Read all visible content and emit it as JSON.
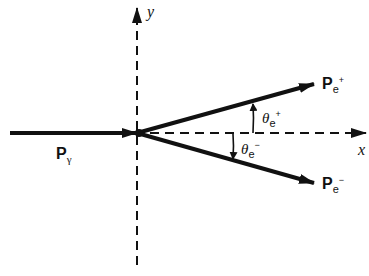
{
  "diagram": {
    "axes": {
      "x_label": "x",
      "y_label": "y"
    },
    "vectors": {
      "photon": {
        "main": "P",
        "sub": "γ"
      },
      "positron": {
        "main": "P",
        "sub": "e",
        "sup": "+"
      },
      "electron": {
        "main": "P",
        "sub": "e",
        "sup": "−"
      }
    },
    "angles": {
      "positron": {
        "symbol": "θ",
        "sub": "e",
        "sup": "+"
      },
      "electron": {
        "symbol": "θ",
        "sub": "e",
        "sup": "−"
      }
    },
    "colors": {
      "ink": "#111111",
      "background": "#ffffff"
    }
  }
}
